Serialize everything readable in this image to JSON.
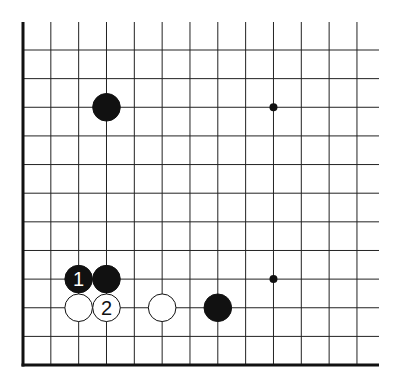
{
  "diagram": {
    "type": "go-board-fragment",
    "corner": "bottom-left",
    "columns": 13,
    "rows": 12,
    "grid": {
      "x0": 23,
      "dx": 27.83,
      "y0": 50,
      "dy": 28.64,
      "top_extend": 22,
      "right_extend": 379,
      "line_color": "#222222",
      "edge_color": "#111111"
    },
    "star_points": [
      {
        "col": 9,
        "row": 2
      },
      {
        "col": 9,
        "row": 8
      }
    ],
    "stones": [
      {
        "color": "black",
        "col": 3,
        "row": 2,
        "label": ""
      },
      {
        "color": "black",
        "col": 2,
        "row": 8,
        "label": "1"
      },
      {
        "color": "black",
        "col": 3,
        "row": 8,
        "label": ""
      },
      {
        "color": "white",
        "col": 2,
        "row": 9,
        "label": ""
      },
      {
        "color": "white",
        "col": 3,
        "row": 9,
        "label": "2"
      },
      {
        "color": "white",
        "col": 5,
        "row": 9,
        "label": ""
      },
      {
        "color": "black",
        "col": 7,
        "row": 9,
        "label": ""
      }
    ],
    "colors": {
      "black_stone": "#111111",
      "white_stone": "#ffffff",
      "stone_outline": "#111111"
    }
  }
}
